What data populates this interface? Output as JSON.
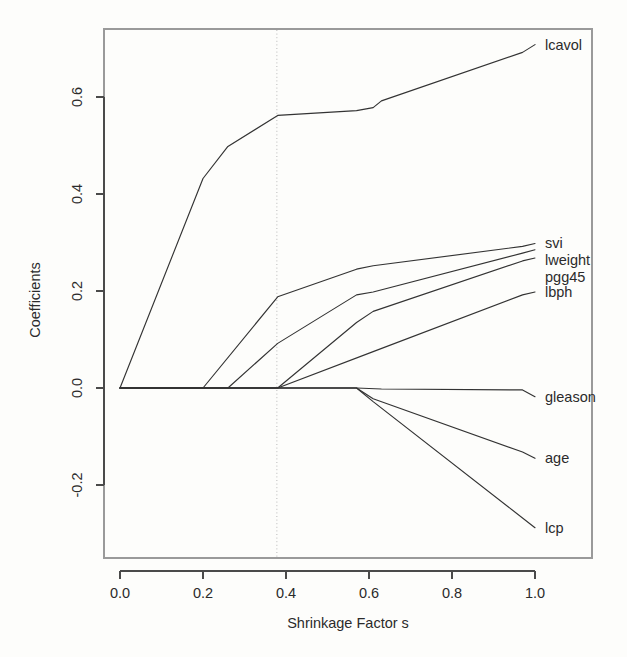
{
  "chart_data": {
    "type": "line",
    "title": "",
    "subtitle": "",
    "xlabel": "Shrinkage Factor s",
    "ylabel": "Coefficients",
    "xlim": [
      -0.03,
      1.06
    ],
    "ylim": [
      -0.32,
      0.74
    ],
    "xticks": [
      0.0,
      0.2,
      0.4,
      0.6,
      0.8,
      1.0
    ],
    "xtick_labels": [
      "0.0",
      "0.2",
      "0.4",
      "0.6",
      "0.8",
      "1.0"
    ],
    "yticks": [
      -0.2,
      0.0,
      0.2,
      0.4,
      0.6
    ],
    "ytick_labels": [
      "-0.2",
      "0.0",
      "0.2",
      "0.4",
      "0.6"
    ],
    "grid": false,
    "legend_position": "right-inline-labels",
    "annotations": [
      {
        "name": "cv-selected-s",
        "type": "vline",
        "x": 0.378,
        "style": "dotted",
        "color": "#b9b9b9"
      }
    ],
    "x": [
      0.0,
      0.2,
      0.26,
      0.38,
      0.57,
      0.61,
      0.63,
      0.97,
      1.0
    ],
    "series": [
      {
        "name": "lcavol",
        "label": "lcavol",
        "color": "#333333",
        "points": [
          [
            0.0,
            0.0
          ],
          [
            0.2,
            0.432
          ],
          [
            0.26,
            0.498
          ],
          [
            0.38,
            0.562
          ],
          [
            0.57,
            0.572
          ],
          [
            0.61,
            0.578
          ],
          [
            0.63,
            0.592
          ],
          [
            0.97,
            0.692
          ],
          [
            1.0,
            0.708
          ]
        ]
      },
      {
        "name": "svi",
        "label": "svi",
        "color": "#333333",
        "points": [
          [
            0.0,
            0.0
          ],
          [
            0.2,
            0.0
          ],
          [
            0.38,
            0.188
          ],
          [
            0.57,
            0.245
          ],
          [
            0.61,
            0.252
          ],
          [
            0.97,
            0.292
          ],
          [
            1.0,
            0.298
          ]
        ]
      },
      {
        "name": "lweight",
        "label": "lweight",
        "color": "#333333",
        "points": [
          [
            0.0,
            0.0
          ],
          [
            0.26,
            0.0
          ],
          [
            0.38,
            0.092
          ],
          [
            0.57,
            0.192
          ],
          [
            0.61,
            0.198
          ],
          [
            0.97,
            0.278
          ],
          [
            1.0,
            0.285
          ]
        ]
      },
      {
        "name": "pgg45",
        "label": "pgg45",
        "color": "#333333",
        "points": [
          [
            0.0,
            0.0
          ],
          [
            0.38,
            0.0
          ],
          [
            0.57,
            0.135
          ],
          [
            0.61,
            0.158
          ],
          [
            0.97,
            0.262
          ],
          [
            1.0,
            0.268
          ]
        ]
      },
      {
        "name": "lbph",
        "label": "lbph",
        "color": "#333333",
        "points": [
          [
            0.0,
            0.0
          ],
          [
            0.38,
            0.0
          ],
          [
            0.61,
            0.075
          ],
          [
            0.97,
            0.192
          ],
          [
            1.0,
            0.198
          ]
        ]
      },
      {
        "name": "gleason",
        "label": "gleason",
        "color": "#333333",
        "points": [
          [
            0.0,
            0.0
          ],
          [
            0.57,
            0.0
          ],
          [
            0.63,
            -0.002
          ],
          [
            0.97,
            -0.004
          ],
          [
            1.0,
            -0.018
          ]
        ]
      },
      {
        "name": "age",
        "label": "age",
        "color": "#333333",
        "points": [
          [
            0.0,
            0.0
          ],
          [
            0.57,
            0.0
          ],
          [
            0.61,
            -0.022
          ],
          [
            0.97,
            -0.132
          ],
          [
            1.0,
            -0.145
          ]
        ]
      },
      {
        "name": "lcp",
        "label": "lcp",
        "color": "#333333",
        "points": [
          [
            0.0,
            0.0
          ],
          [
            0.57,
            0.0
          ],
          [
            0.61,
            -0.028
          ],
          [
            1.0,
            -0.288
          ]
        ]
      }
    ],
    "series_labels": [
      {
        "name": "lcavol",
        "text": "lcavol",
        "x": 1.0,
        "y": 0.708,
        "dx": 10,
        "dy": 5
      },
      {
        "name": "svi",
        "text": "svi",
        "x": 1.0,
        "y": 0.298,
        "dx": 10,
        "dy": 5
      },
      {
        "name": "lweight",
        "text": "lweight",
        "x": 1.0,
        "y": 0.285,
        "dx": 10,
        "dy": 15
      },
      {
        "name": "pgg45",
        "text": "pgg45",
        "x": 1.0,
        "y": 0.268,
        "dx": 10,
        "dy": 24
      },
      {
        "name": "lbph",
        "text": "lbph",
        "x": 1.0,
        "y": 0.198,
        "dx": 10,
        "dy": 5
      },
      {
        "name": "gleason",
        "text": "gleason",
        "x": 1.0,
        "y": -0.018,
        "dx": 10,
        "dy": 5
      },
      {
        "name": "age",
        "text": "age",
        "x": 1.0,
        "y": -0.145,
        "dx": 10,
        "dy": 5
      },
      {
        "name": "lcp",
        "text": "lcp",
        "x": 1.0,
        "y": -0.288,
        "dx": 10,
        "dy": 5
      }
    ]
  }
}
